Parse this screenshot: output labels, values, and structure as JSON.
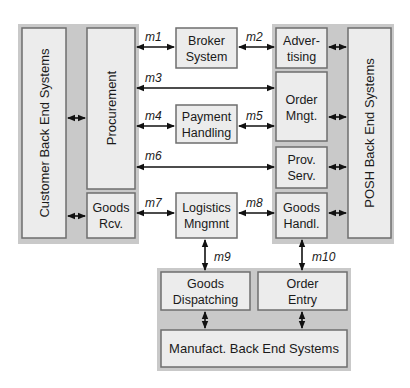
{
  "diagram": {
    "groups": {
      "customer_side": "Customer Back End Systems",
      "posh_side": "POSH Back End Systems",
      "manufacturer_side": "Manufact. Back End Systems"
    },
    "boxes": {
      "procurement": "Procurement",
      "goods_rcv": [
        "Goods",
        "Rcv."
      ],
      "broker": [
        "Broker",
        "System"
      ],
      "payment": [
        "Payment",
        "Handling"
      ],
      "logistics": [
        "Logistics",
        "Mngmnt"
      ],
      "advertising": [
        "Adver-",
        "tising"
      ],
      "order_mngt": [
        "Order",
        "Mngt."
      ],
      "prov_serv": [
        "Prov.",
        "Serv."
      ],
      "goods_handl": [
        "Goods",
        "Handl."
      ],
      "goods_dispatching": [
        "Goods",
        "Dispatching"
      ],
      "order_entry": [
        "Order",
        "Entry"
      ]
    },
    "messages": {
      "m1": "m1",
      "m2": "m2",
      "m3": "m3",
      "m4": "m4",
      "m5": "m5",
      "m6": "m6",
      "m7": "m7",
      "m8": "m8",
      "m9": "m9",
      "m10": "m10"
    },
    "colors": {
      "backdrop": "#c9c9c9",
      "box_fill": "#ececec",
      "box_border": "#6e6e6e",
      "arrow": "#111111"
    }
  }
}
